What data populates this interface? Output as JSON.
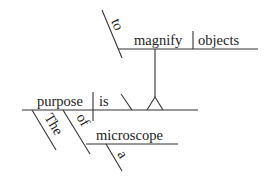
{
  "diagram": {
    "type": "sentence-diagram",
    "sentence": "The purpose of a microscope is to magnify objects.",
    "words": {
      "subject": "purpose",
      "verb": "is",
      "subject_article": "The",
      "preposition": "of",
      "prep_object": "microscope",
      "prep_object_article": "a",
      "infinitive_marker": "to",
      "infinitive_verb": "magnify",
      "infinitive_object": "objects"
    },
    "colors": {
      "line": "#333333",
      "text": "#222222",
      "background": "#ffffff"
    }
  }
}
